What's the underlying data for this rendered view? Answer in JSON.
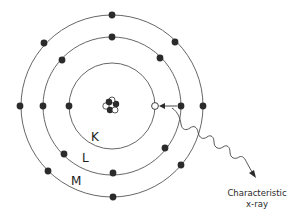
{
  "diagram": {
    "center": [
      112,
      106
    ],
    "shells": [
      {
        "name": "K",
        "radius": 43,
        "label_pos": [
          90,
          128
        ]
      },
      {
        "name": "L",
        "radius": 69,
        "label_pos": [
          81,
          150
        ]
      },
      {
        "name": "M",
        "radius": 91,
        "label_pos": [
          70,
          172
        ]
      }
    ],
    "electrons": [
      {
        "shell": "K",
        "x": 69,
        "y": 106,
        "filled": true
      },
      {
        "shell": "K",
        "x": 155,
        "y": 106,
        "filled": false,
        "note": "vacancy"
      },
      {
        "shell": "L",
        "x": 43,
        "y": 106,
        "filled": true
      },
      {
        "shell": "L",
        "x": 62,
        "y": 60,
        "filled": true
      },
      {
        "shell": "L",
        "x": 112,
        "y": 37,
        "filled": true
      },
      {
        "shell": "L",
        "x": 160,
        "y": 58,
        "filled": true
      },
      {
        "shell": "L",
        "x": 181,
        "y": 106,
        "filled": true
      },
      {
        "shell": "L",
        "x": 165,
        "y": 148,
        "filled": true
      },
      {
        "shell": "L",
        "x": 113,
        "y": 173,
        "filled": true
      },
      {
        "shell": "L",
        "x": 64,
        "y": 154,
        "filled": true
      },
      {
        "shell": "M",
        "x": 20,
        "y": 106,
        "filled": true
      },
      {
        "shell": "M",
        "x": 44,
        "y": 43,
        "filled": true
      },
      {
        "shell": "M",
        "x": 112,
        "y": 15,
        "filled": true
      },
      {
        "shell": "M",
        "x": 175,
        "y": 42,
        "filled": true
      },
      {
        "shell": "M",
        "x": 203,
        "y": 106,
        "filled": true
      },
      {
        "shell": "M",
        "x": 181,
        "y": 165,
        "filled": true
      },
      {
        "shell": "M",
        "x": 113,
        "y": 197,
        "filled": true
      },
      {
        "shell": "M",
        "x": 48,
        "y": 171,
        "filled": true
      }
    ],
    "nucleus": {
      "label": "nucleus"
    },
    "transition": {
      "from": "L",
      "to": "K",
      "arrow": "electron transition"
    },
    "caption": {
      "line1": "Characteristic",
      "line2": "x-ray"
    },
    "labels": {
      "k": "K",
      "l": "L",
      "m": "M"
    },
    "colors": {
      "stroke": "#555555",
      "electron": "#2b2b2b",
      "background": "#ffffff"
    }
  }
}
